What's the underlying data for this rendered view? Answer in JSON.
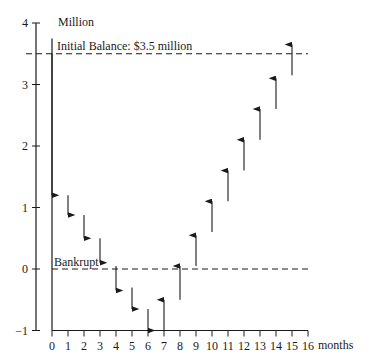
{
  "chart_data": {
    "type": "arrow-cashflow",
    "title": "",
    "ylabel": "Million",
    "xlabel": "months",
    "ylim": [
      -1,
      4
    ],
    "xlim": [
      0,
      16
    ],
    "yticks": [
      4,
      3,
      2,
      1,
      0,
      -1
    ],
    "xticks": [
      0,
      1,
      2,
      3,
      4,
      5,
      6,
      7,
      8,
      9,
      10,
      11,
      12,
      13,
      14,
      15,
      16
    ],
    "grid": false,
    "reference_lines": [
      {
        "name": "initial-balance",
        "value": 3.5,
        "label": "Initial Balance: $3.5 million",
        "style": "dashed"
      },
      {
        "name": "bankrupt",
        "value": 0,
        "label": "Bankrupt",
        "style": "dashed"
      }
    ],
    "arrows": [
      {
        "month": 0,
        "from": 3.5,
        "to": 1.2,
        "direction": "down"
      },
      {
        "month": 1,
        "from": 1.2,
        "to": 0.88,
        "direction": "down"
      },
      {
        "month": 2,
        "from": 0.88,
        "to": 0.5,
        "direction": "down"
      },
      {
        "month": 3,
        "from": 0.5,
        "to": 0.1,
        "direction": "down"
      },
      {
        "month": 4,
        "from": 0.05,
        "to": -0.35,
        "direction": "down"
      },
      {
        "month": 5,
        "from": -0.3,
        "to": -0.65,
        "direction": "down"
      },
      {
        "month": 6,
        "from": -0.65,
        "to": -1.0,
        "direction": "down"
      },
      {
        "month": 7,
        "from": -1.0,
        "to": -0.5,
        "direction": "up"
      },
      {
        "month": 8,
        "from": -0.5,
        "to": 0.05,
        "direction": "up"
      },
      {
        "month": 9,
        "from": 0.05,
        "to": 0.55,
        "direction": "up"
      },
      {
        "month": 10,
        "from": 0.6,
        "to": 1.1,
        "direction": "up"
      },
      {
        "month": 11,
        "from": 1.1,
        "to": 1.6,
        "direction": "up"
      },
      {
        "month": 12,
        "from": 1.6,
        "to": 2.1,
        "direction": "up"
      },
      {
        "month": 13,
        "from": 2.1,
        "to": 2.6,
        "direction": "up"
      },
      {
        "month": 14,
        "from": 2.6,
        "to": 3.1,
        "direction": "up"
      },
      {
        "month": 15,
        "from": 3.15,
        "to": 3.65,
        "direction": "up"
      }
    ]
  },
  "labels": {
    "ylabel": "Million",
    "xlabel": "months",
    "initial_balance": "Initial Balance: $3.5 million",
    "bankrupt": "Bankrupt"
  }
}
